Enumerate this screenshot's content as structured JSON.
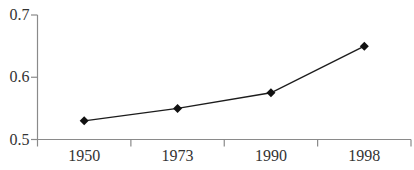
{
  "chart_data": {
    "type": "line",
    "categories": [
      "1950",
      "1973",
      "1990",
      "1998"
    ],
    "values": [
      0.53,
      0.55,
      0.575,
      0.65
    ],
    "ylim": [
      0.5,
      0.7
    ],
    "yticks": [
      "0.5",
      "0.6",
      "0.7"
    ],
    "ytick_values": [
      0.5,
      0.6,
      0.7
    ],
    "grid": false,
    "legend": false,
    "marker": "diamond",
    "colors": {
      "line": "#1c1c1c",
      "marker": "#111111",
      "axis": "#8a8a8a",
      "text": "#333333",
      "background": "#ffffff"
    }
  }
}
